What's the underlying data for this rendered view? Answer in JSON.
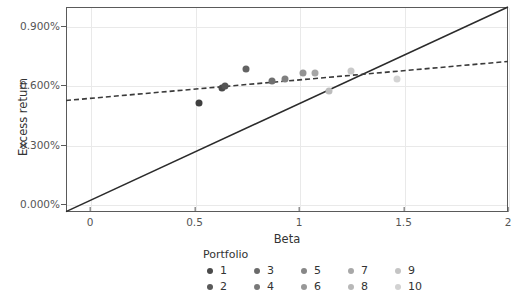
{
  "chart_data": {
    "type": "scatter",
    "title": "",
    "xlabel": "Beta",
    "ylabel": "Excess return",
    "xlim": [
      -0.115,
      2.0
    ],
    "ylim": [
      -0.04,
      0.995
    ],
    "xticks": [
      0,
      0.5,
      1,
      1.5,
      2
    ],
    "xticklabels": [
      "0",
      "0.5",
      "1",
      "1.5",
      "2"
    ],
    "yticks": [
      0.0,
      0.3,
      0.6,
      0.9
    ],
    "yticklabels": [
      "0.000%",
      "0.300%",
      "0.600%",
      "0.900%"
    ],
    "grid": true,
    "legend_position": "bottom",
    "legend_title": "Portfolio",
    "series": [
      {
        "name": "Portfolio",
        "points": [
          {
            "label": "1",
            "x": 0.52,
            "y": 0.51,
            "color": "#3f3f3f"
          },
          {
            "label": "2",
            "x": 0.63,
            "y": 0.588,
            "color": "#4a4a4a"
          },
          {
            "label": "3",
            "x": 0.645,
            "y": 0.597,
            "color": "#555555"
          },
          {
            "label": "4",
            "x": 0.745,
            "y": 0.68,
            "color": "#636363"
          },
          {
            "label": "5",
            "x": 0.87,
            "y": 0.622,
            "color": "#6f6f6f"
          },
          {
            "label": "6",
            "x": 0.935,
            "y": 0.63,
            "color": "#808080"
          },
          {
            "label": "7",
            "x": 1.02,
            "y": 0.66,
            "color": "#939393"
          },
          {
            "label": "8",
            "x": 1.075,
            "y": 0.662,
            "color": "#a6a6a6"
          },
          {
            "label": "9",
            "x": 1.145,
            "y": 0.572,
            "color": "#bcbcbc"
          },
          {
            "label": "10",
            "x": 1.25,
            "y": 0.672,
            "color": "#c9c9c9"
          },
          {
            "label": "10",
            "x": 1.47,
            "y": 0.63,
            "color": "#d4d4d4"
          }
        ]
      }
    ],
    "lines": [
      {
        "name": "security-market-line",
        "style": "solid",
        "color": "#2b2b2b",
        "x0": -0.115,
        "y0": -0.038,
        "x1": 2.0,
        "y1": 0.995
      },
      {
        "name": "fitted-regression-line",
        "style": "dashed",
        "color": "#3a3a3a",
        "x0": -0.115,
        "y0": 0.523,
        "x1": 2.0,
        "y1": 0.72
      }
    ]
  },
  "legend": {
    "title": "Portfolio",
    "rows": [
      [
        {
          "label": "1",
          "color": "#4a4a4a"
        },
        {
          "label": "3",
          "color": "#6a6a6a"
        },
        {
          "label": "5",
          "color": "#878787"
        },
        {
          "label": "7",
          "color": "#a8a8a8"
        },
        {
          "label": "9",
          "color": "#c4c4c4"
        }
      ],
      [
        {
          "label": "2",
          "color": "#5a5a5a"
        },
        {
          "label": "4",
          "color": "#787878"
        },
        {
          "label": "6",
          "color": "#989898"
        },
        {
          "label": "8",
          "color": "#b8b8b8"
        },
        {
          "label": "10",
          "color": "#d2d2d2"
        }
      ]
    ]
  }
}
